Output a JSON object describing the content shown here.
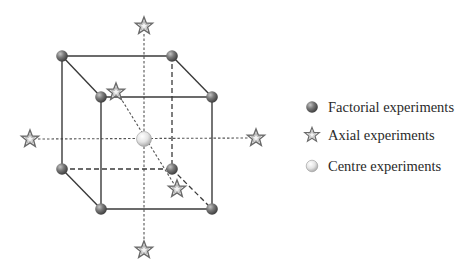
{
  "diagram": {
    "colors": {
      "edge": "#3a3a3a",
      "dashed": "#4a4a4a",
      "factorial_fill": "#6f6f6f",
      "factorial_highlight": "#b5b5b5",
      "axial_stroke": "#6a6a6a",
      "axial_fill": "#f2f2f2",
      "centre_fill": "#e6e6e6",
      "centre_highlight": "#ffffff"
    },
    "cube": {
      "back_face": {
        "tl": [
          62,
          56
        ],
        "tr": [
          172,
          56
        ],
        "bl": [
          62,
          169
        ],
        "br": [
          172,
          169
        ]
      },
      "front_face": {
        "tl": [
          101,
          97
        ],
        "tr": [
          212,
          97
        ],
        "bl": [
          101,
          209
        ],
        "br": [
          212,
          209
        ]
      }
    },
    "factorial_points": [
      {
        "id": "back-top-left",
        "x": 62,
        "y": 56
      },
      {
        "id": "back-top-right",
        "x": 172,
        "y": 56
      },
      {
        "id": "back-bottom-left",
        "x": 62,
        "y": 169
      },
      {
        "id": "back-bottom-right",
        "x": 172,
        "y": 169
      },
      {
        "id": "front-top-left",
        "x": 101,
        "y": 97
      },
      {
        "id": "front-top-right",
        "x": 212,
        "y": 97
      },
      {
        "id": "front-bottom-left",
        "x": 101,
        "y": 209
      },
      {
        "id": "front-bottom-right",
        "x": 212,
        "y": 209
      }
    ],
    "axial_points": [
      {
        "id": "top",
        "x": 144,
        "y": 26
      },
      {
        "id": "bottom",
        "x": 144,
        "y": 250
      },
      {
        "id": "left",
        "x": 30,
        "y": 139
      },
      {
        "id": "right",
        "x": 256,
        "y": 138
      },
      {
        "id": "back-diagonal",
        "x": 116,
        "y": 92
      },
      {
        "id": "front-diagonal",
        "x": 177,
        "y": 189
      }
    ],
    "centre_point": {
      "x": 144,
      "y": 139
    }
  },
  "legend": {
    "items": [
      {
        "icon": "factorial-sphere-icon",
        "label": "Factorial experiments"
      },
      {
        "icon": "axial-star-icon",
        "label": "Axial experiments"
      },
      {
        "icon": "centre-sphere-icon",
        "label": "Centre experiments"
      }
    ]
  }
}
